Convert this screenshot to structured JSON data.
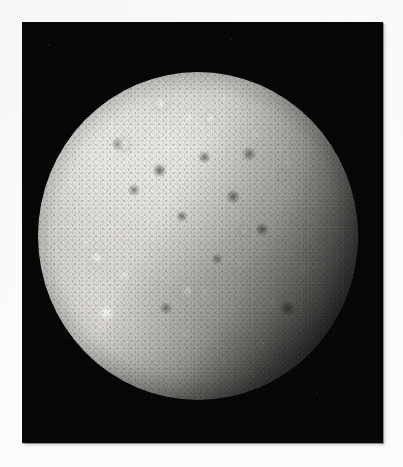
{
  "page": {
    "background_color": "#fcfcfa"
  },
  "plate": {
    "name": "callisto-photograph",
    "background_color": "#030303",
    "x": 22,
    "y": 22,
    "width": 361,
    "height": 421,
    "caption": ""
  },
  "subject": {
    "object_name": "Callisto",
    "type": "moon",
    "illumination": "sunlit from upper-left, terminator toward lower-right",
    "surface": "heavily cratered icy crust with bright impact-crater rays",
    "disk": {
      "center_x": 198,
      "center_y": 236,
      "radius": 160,
      "base_color": "#9d9b96",
      "highlight_color": "#e9e7e2",
      "shadow_color": "#0d0d0c"
    },
    "features": [
      {
        "name": "valhalla-basin",
        "label": "Bright multi-ring basin",
        "x": 108,
        "y": 300,
        "size": 92
      },
      {
        "name": "bright-crater-a",
        "label": "Bright rayed crater",
        "x": 100,
        "y": 311,
        "size": 22
      },
      {
        "name": "bright-crater-b",
        "label": "Bright rayed crater",
        "x": 95,
        "y": 265,
        "size": 16
      },
      {
        "name": "bright-crater-c",
        "label": "Bright rayed crater",
        "x": 158,
        "y": 100,
        "size": 18
      },
      {
        "name": "bright-crater-d",
        "label": "Bright rayed crater",
        "x": 210,
        "y": 118,
        "size": 14
      },
      {
        "name": "bright-crater-e",
        "label": "Bright rayed crater",
        "x": 186,
        "y": 290,
        "size": 13
      },
      {
        "name": "dark-terrain-band",
        "label": "Dark cratered plains",
        "x": 230,
        "y": 200,
        "size": 150
      }
    ],
    "sky": {
      "color": "#030303",
      "specks": [
        {
          "name": "dust-speck",
          "x": 48,
          "y": 44,
          "size": 2
        },
        {
          "name": "dust-speck",
          "x": 230,
          "y": 38,
          "size": 2
        },
        {
          "name": "dust-speck",
          "x": 316,
          "y": 392,
          "size": 2
        }
      ]
    }
  }
}
